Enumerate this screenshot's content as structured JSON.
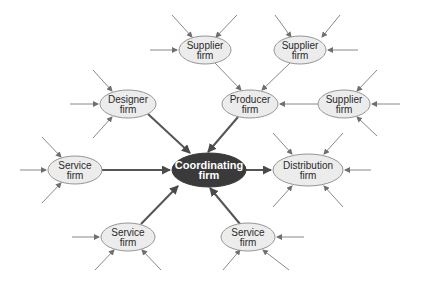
{
  "diagram": {
    "title": "",
    "colors": {
      "node_fill": "#ececec",
      "node_stroke": "#8a8a8a",
      "hub_fill": "#3a3a3a",
      "thin_arrow": "#7a7a7a",
      "thick_arrow": "#555555"
    },
    "nodes": [
      {
        "id": "coordinating",
        "line1": "Coordinating",
        "line2": "firm",
        "cx": 209,
        "cy": 170,
        "rx": 37,
        "ry": 17,
        "hub": true
      },
      {
        "id": "supplier1",
        "line1": "Supplier",
        "line2": "firm",
        "cx": 205,
        "cy": 50,
        "rx": 26,
        "ry": 14
      },
      {
        "id": "supplier2",
        "line1": "Supplier",
        "line2": "firm",
        "cx": 300,
        "cy": 50,
        "rx": 26,
        "ry": 14
      },
      {
        "id": "supplier3",
        "line1": "Supplier",
        "line2": "firm",
        "cx": 344,
        "cy": 104,
        "rx": 26,
        "ry": 14
      },
      {
        "id": "designer",
        "line1": "Designer",
        "line2": "firm",
        "cx": 128,
        "cy": 104,
        "rx": 28,
        "ry": 14
      },
      {
        "id": "producer",
        "line1": "Producer",
        "line2": "firm",
        "cx": 250,
        "cy": 104,
        "rx": 28,
        "ry": 14
      },
      {
        "id": "service_left",
        "line1": "Service",
        "line2": "firm",
        "cx": 75,
        "cy": 170,
        "rx": 27,
        "ry": 14
      },
      {
        "id": "distribution",
        "line1": "Distribution",
        "line2": "firm",
        "cx": 308,
        "cy": 170,
        "rx": 35,
        "ry": 16
      },
      {
        "id": "service_bl",
        "line1": "Service",
        "line2": "firm",
        "cx": 128,
        "cy": 237,
        "rx": 27,
        "ry": 14
      },
      {
        "id": "service_br",
        "line1": "Service",
        "line2": "firm",
        "cx": 248,
        "cy": 237,
        "rx": 27,
        "ry": 14
      }
    ],
    "edges": [
      {
        "from": "designer",
        "to": "coordinating",
        "x1": 148,
        "y1": 114,
        "x2": 190,
        "y2": 153,
        "thick": true
      },
      {
        "from": "producer",
        "to": "coordinating",
        "x1": 238,
        "y1": 117,
        "x2": 208,
        "y2": 152,
        "thick": true
      },
      {
        "from": "service_left",
        "to": "coordinating",
        "x1": 102,
        "y1": 170,
        "x2": 170,
        "y2": 170,
        "thick": true
      },
      {
        "from": "coordinating",
        "to": "distribution",
        "x1": 246,
        "y1": 170,
        "x2": 271,
        "y2": 170,
        "thick": true
      },
      {
        "from": "service_bl",
        "to": "coordinating",
        "x1": 141,
        "y1": 224,
        "x2": 178,
        "y2": 186,
        "thick": true
      },
      {
        "from": "service_br",
        "to": "coordinating",
        "x1": 240,
        "y1": 224,
        "x2": 210,
        "y2": 188,
        "thick": true
      },
      {
        "from": "supplier1",
        "to": "producer",
        "x1": 215,
        "y1": 63,
        "x2": 241,
        "y2": 90,
        "thick": false
      },
      {
        "from": "supplier2",
        "to": "producer",
        "x1": 290,
        "y1": 63,
        "x2": 262,
        "y2": 90,
        "thick": false
      },
      {
        "from": "supplier3",
        "to": "producer",
        "x1": 318,
        "y1": 104,
        "x2": 280,
        "y2": 104,
        "thick": false
      }
    ],
    "stub_arrows": [
      {
        "target": "supplier1",
        "x1": 172,
        "y1": 15,
        "x2": 192,
        "y2": 37
      },
      {
        "target": "supplier1",
        "x1": 237,
        "y1": 15,
        "x2": 216,
        "y2": 37
      },
      {
        "target": "supplier1",
        "x1": 150,
        "y1": 50,
        "x2": 177,
        "y2": 50
      },
      {
        "target": "supplier2",
        "x1": 275,
        "y1": 15,
        "x2": 291,
        "y2": 37
      },
      {
        "target": "supplier2",
        "x1": 340,
        "y1": 15,
        "x2": 322,
        "y2": 37
      },
      {
        "target": "supplier2",
        "x1": 358,
        "y1": 50,
        "x2": 328,
        "y2": 50
      },
      {
        "target": "supplier3",
        "x1": 377,
        "y1": 70,
        "x2": 357,
        "y2": 91
      },
      {
        "target": "supplier3",
        "x1": 400,
        "y1": 104,
        "x2": 372,
        "y2": 104
      },
      {
        "target": "supplier3",
        "x1": 377,
        "y1": 136,
        "x2": 357,
        "y2": 117
      },
      {
        "target": "designer",
        "x1": 93,
        "y1": 70,
        "x2": 112,
        "y2": 91
      },
      {
        "target": "designer",
        "x1": 70,
        "y1": 104,
        "x2": 98,
        "y2": 104
      },
      {
        "target": "designer",
        "x1": 93,
        "y1": 138,
        "x2": 112,
        "y2": 117
      },
      {
        "target": "service_left",
        "x1": 42,
        "y1": 137,
        "x2": 61,
        "y2": 157
      },
      {
        "target": "service_left",
        "x1": 20,
        "y1": 170,
        "x2": 46,
        "y2": 170
      },
      {
        "target": "service_left",
        "x1": 42,
        "y1": 203,
        "x2": 61,
        "y2": 183
      },
      {
        "target": "distribution",
        "x1": 273,
        "y1": 133,
        "x2": 292,
        "y2": 154
      },
      {
        "target": "distribution",
        "x1": 343,
        "y1": 133,
        "x2": 324,
        "y2": 154
      },
      {
        "target": "distribution",
        "x1": 371,
        "y1": 170,
        "x2": 345,
        "y2": 170
      },
      {
        "target": "distribution",
        "x1": 273,
        "y1": 207,
        "x2": 292,
        "y2": 186
      },
      {
        "target": "distribution",
        "x1": 343,
        "y1": 207,
        "x2": 324,
        "y2": 186
      },
      {
        "target": "service_bl",
        "x1": 72,
        "y1": 237,
        "x2": 99,
        "y2": 237
      },
      {
        "target": "service_bl",
        "x1": 95,
        "y1": 270,
        "x2": 114,
        "y2": 250
      },
      {
        "target": "service_bl",
        "x1": 161,
        "y1": 270,
        "x2": 142,
        "y2": 250
      },
      {
        "target": "service_br",
        "x1": 304,
        "y1": 237,
        "x2": 277,
        "y2": 237
      },
      {
        "target": "service_br",
        "x1": 223,
        "y1": 270,
        "x2": 240,
        "y2": 250
      },
      {
        "target": "service_br",
        "x1": 289,
        "y1": 270,
        "x2": 263,
        "y2": 250
      }
    ]
  }
}
